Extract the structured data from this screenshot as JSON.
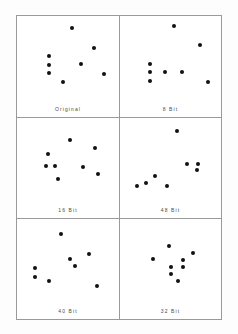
{
  "page": {
    "background_color": "#fdfdfd",
    "figure_border_color": "#9a9a9a",
    "dot_color": "#111111",
    "caption_color": "#4a4a4a",
    "header_faint_text": "· · ·"
  },
  "chart_data": {
    "type": "scatter",
    "title": "",
    "xlabel": "",
    "ylabel": "",
    "xlim": [
      0,
      100
    ],
    "ylim": [
      0,
      100
    ],
    "grid": false,
    "legend": "none",
    "layout": {
      "rows": 3,
      "cols": 2
    },
    "panels": [
      {
        "label": "Original",
        "points": [
          {
            "x": 54,
            "y": 86
          },
          {
            "x": 75,
            "y": 62
          },
          {
            "x": 31,
            "y": 52
          },
          {
            "x": 31,
            "y": 41
          },
          {
            "x": 63,
            "y": 42
          },
          {
            "x": 31,
            "y": 31
          },
          {
            "x": 85,
            "y": 30
          },
          {
            "x": 45,
            "y": 21
          }
        ]
      },
      {
        "label": "8 Bit",
        "points": [
          {
            "x": 53,
            "y": 88
          },
          {
            "x": 79,
            "y": 65
          },
          {
            "x": 30,
            "y": 42
          },
          {
            "x": 30,
            "y": 32
          },
          {
            "x": 45,
            "y": 32
          },
          {
            "x": 61,
            "y": 32
          },
          {
            "x": 30,
            "y": 22
          },
          {
            "x": 87,
            "y": 21
          }
        ]
      },
      {
        "label": "16 Bit",
        "points": [
          {
            "x": 52,
            "y": 73
          },
          {
            "x": 76,
            "y": 64
          },
          {
            "x": 30,
            "y": 56
          },
          {
            "x": 28,
            "y": 41
          },
          {
            "x": 37,
            "y": 41
          },
          {
            "x": 65,
            "y": 40
          },
          {
            "x": 79,
            "y": 32
          },
          {
            "x": 40,
            "y": 26
          }
        ]
      },
      {
        "label": "48 Bit",
        "points": [
          {
            "x": 56,
            "y": 84
          },
          {
            "x": 66,
            "y": 44
          },
          {
            "x": 77,
            "y": 44
          },
          {
            "x": 76,
            "y": 36
          },
          {
            "x": 35,
            "y": 29
          },
          {
            "x": 26,
            "y": 21
          },
          {
            "x": 17,
            "y": 17
          },
          {
            "x": 47,
            "y": 17
          }
        ]
      },
      {
        "label": "40 Bit",
        "points": [
          {
            "x": 43,
            "y": 82
          },
          {
            "x": 71,
            "y": 57
          },
          {
            "x": 52,
            "y": 51
          },
          {
            "x": 57,
            "y": 43
          },
          {
            "x": 18,
            "y": 40
          },
          {
            "x": 18,
            "y": 29
          },
          {
            "x": 31,
            "y": 24
          },
          {
            "x": 78,
            "y": 18
          }
        ]
      },
      {
        "label": "32 Bit",
        "points": [
          {
            "x": 49,
            "y": 67
          },
          {
            "x": 72,
            "y": 58
          },
          {
            "x": 33,
            "y": 51
          },
          {
            "x": 62,
            "y": 50
          },
          {
            "x": 50,
            "y": 41
          },
          {
            "x": 62,
            "y": 41
          },
          {
            "x": 50,
            "y": 33
          },
          {
            "x": 57,
            "y": 24
          }
        ]
      }
    ]
  }
}
